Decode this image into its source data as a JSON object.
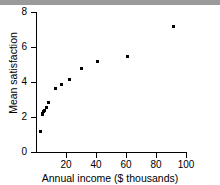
{
  "chart_data": {
    "type": "scatter",
    "title": "",
    "xlabel": "Annual income ($ thousands)",
    "ylabel": "Mean satisfaction",
    "xlim": [
      0,
      100
    ],
    "ylim": [
      0,
      8
    ],
    "xticks": [
      20,
      40,
      60,
      80,
      100
    ],
    "xtick_labels": [
      "20",
      "40",
      "60",
      "80",
      "100"
    ],
    "yticks": [
      0,
      2,
      4,
      6,
      8
    ],
    "ytick_labels": [
      "0",
      "2",
      "4",
      "6",
      "8"
    ],
    "grid": false,
    "legend": false,
    "marker": "square",
    "marker_color": "#000000",
    "points": [
      {
        "x": 3.0,
        "y": 1.2
      },
      {
        "x": 4.0,
        "y": 2.15
      },
      {
        "x": 4.6,
        "y": 2.22
      },
      {
        "x": 5.2,
        "y": 2.3
      },
      {
        "x": 5.8,
        "y": 2.4
      },
      {
        "x": 7.0,
        "y": 2.55
      },
      {
        "x": 8.5,
        "y": 2.85
      },
      {
        "x": 13.0,
        "y": 3.65
      },
      {
        "x": 17.0,
        "y": 3.88
      },
      {
        "x": 22.5,
        "y": 4.12
      },
      {
        "x": 30.5,
        "y": 4.78
      },
      {
        "x": 41.0,
        "y": 5.2
      },
      {
        "x": 61.0,
        "y": 5.47
      },
      {
        "x": 91.5,
        "y": 7.18
      }
    ]
  },
  "figure": {
    "top_bar_color": "#9a9a9a",
    "background": "#ffffff"
  }
}
